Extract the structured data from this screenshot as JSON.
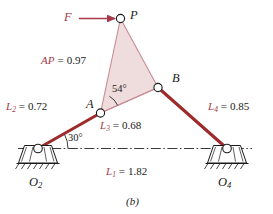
{
  "figure": {
    "caption": "(b)",
    "type": "fourbar-linkage-kinematic-diagram"
  },
  "colors": {
    "link_red": "#9e2b2b",
    "label_red": "#a63a4a",
    "coupler_fill": "#efdcdc",
    "coupler_stroke": "#c98b93",
    "ink": "#1a1a1a",
    "ground_line": "#3a3a3a"
  },
  "points": {
    "P": {
      "label": "P"
    },
    "A": {
      "label": "A"
    },
    "B": {
      "label": "B"
    },
    "O2": {
      "label": "O",
      "sub": "2"
    },
    "O4": {
      "label": "O",
      "sub": "4"
    }
  },
  "force": {
    "label": "F",
    "arrow": "right-arrow-icon"
  },
  "dimensions": {
    "AP": {
      "name": "AP",
      "sub": "",
      "eq": "=",
      "value": "0.97"
    },
    "L1": {
      "name": "L",
      "sub": "1",
      "eq": "=",
      "value": "1.82"
    },
    "L2": {
      "name": "L",
      "sub": "2",
      "eq": "=",
      "value": "0.72"
    },
    "L3": {
      "name": "L",
      "sub": "3",
      "eq": "=",
      "value": "0.68"
    },
    "L4": {
      "name": "L",
      "sub": "4",
      "eq": "=",
      "value": "0.85"
    }
  },
  "angles": {
    "theta2": "30°",
    "coupler": "54°"
  }
}
